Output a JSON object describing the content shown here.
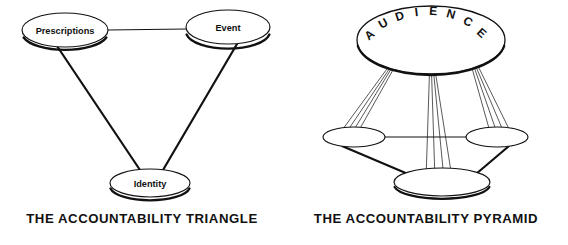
{
  "figure": {
    "background_color": "#ffffff",
    "ink_color": "#111111",
    "panels": [
      {
        "id": "accountability-triangle",
        "caption": "THE ACCOUNTABILITY TRIANGLE",
        "shape": "triangle",
        "nodes": [
          {
            "id": "prescriptions",
            "label": "Prescriptions",
            "cx": 65,
            "cy": 30,
            "rx": 43,
            "ry": 17
          },
          {
            "id": "event",
            "label": "Event",
            "cx": 228,
            "cy": 27,
            "rx": 42,
            "ry": 17
          },
          {
            "id": "identity",
            "label": "Identity",
            "cx": 150,
            "cy": 183,
            "rx": 40,
            "ry": 14
          }
        ],
        "edges": [
          {
            "from": "prescriptions",
            "to": "event",
            "weight": "thin"
          },
          {
            "from": "prescriptions",
            "to": "identity",
            "weight": "thick"
          },
          {
            "from": "event",
            "to": "identity",
            "weight": "thick"
          }
        ]
      },
      {
        "id": "accountability-pyramid",
        "caption": "THE ACCOUNTABILITY PYRAMID",
        "shape": "pyramid",
        "audience": {
          "id": "audience",
          "label": "AUDIENCE",
          "letters": [
            "A",
            "U",
            "D",
            "I",
            "E",
            "N",
            "C",
            "E"
          ],
          "cx": 147,
          "cy": 40,
          "rx": 74,
          "ry": 34,
          "shaded": true
        },
        "nodes": [
          {
            "id": "base-left",
            "label": "",
            "cx": 70,
            "cy": 137,
            "rx": 31,
            "ry": 10
          },
          {
            "id": "base-right",
            "label": "",
            "cx": 213,
            "cy": 137,
            "rx": 31,
            "ry": 10
          },
          {
            "id": "base-bottom",
            "label": "",
            "cx": 158,
            "cy": 182,
            "rx": 48,
            "ry": 14
          }
        ],
        "edges": [
          {
            "from": "base-left",
            "to": "base-right",
            "weight": "thin"
          },
          {
            "from": "base-left",
            "to": "base-bottom",
            "weight": "thick"
          },
          {
            "from": "base-right",
            "to": "base-bottom",
            "weight": "thick"
          }
        ],
        "ray_bundles": [
          {
            "origin_x": 108,
            "origin_y": 62,
            "target": "base-left",
            "count": 4
          },
          {
            "origin_x": 147,
            "origin_y": 58,
            "target": "base-bottom",
            "count": 4
          },
          {
            "origin_x": 190,
            "origin_y": 62,
            "target": "base-right",
            "count": 4
          }
        ]
      }
    ]
  }
}
